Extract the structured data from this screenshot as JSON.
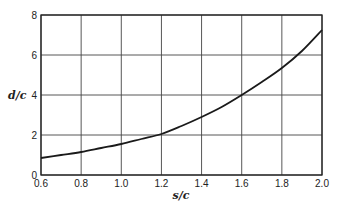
{
  "chart_data": {
    "type": "line",
    "title": "",
    "xlabel": "s/c",
    "ylabel": "d/c",
    "xlim": [
      0.6,
      2.0
    ],
    "ylim": [
      0,
      8
    ],
    "grid": true,
    "legend": null,
    "x_ticks": [
      0.6,
      0.8,
      1.0,
      1.2,
      1.4,
      1.6,
      1.8,
      2.0
    ],
    "x_tick_labels": [
      "0.6",
      "0.8",
      "1.0",
      "1.2",
      "1.4",
      "1.6",
      "1.8",
      "2.0"
    ],
    "y_ticks": [
      0,
      2,
      4,
      6,
      8
    ],
    "y_tick_labels": [
      "0",
      "2",
      "4",
      "6",
      "8"
    ],
    "series": [
      {
        "name": "d/c vs s/c",
        "x": [
          0.6,
          0.7,
          0.8,
          0.9,
          1.0,
          1.1,
          1.2,
          1.3,
          1.4,
          1.5,
          1.6,
          1.7,
          1.8,
          1.9,
          2.0
        ],
        "values": [
          0.85,
          1.0,
          1.15,
          1.35,
          1.55,
          1.8,
          2.05,
          2.45,
          2.9,
          3.4,
          4.0,
          4.65,
          5.35,
          6.2,
          7.25
        ]
      }
    ]
  },
  "layout": {
    "plot_left": 41,
    "plot_right": 322,
    "plot_top": 15,
    "plot_bottom": 175,
    "line_color": "#1a1a1a",
    "grid_color": "#444444"
  }
}
